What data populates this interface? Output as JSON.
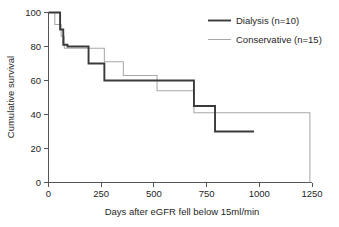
{
  "chart_data": {
    "type": "line",
    "title": "",
    "subtitle": "",
    "xlabel": "Days after eGFR fell below 15ml/min",
    "ylabel": "Cumulative survival",
    "xlim": [
      0,
      1250
    ],
    "ylim": [
      0,
      100
    ],
    "xticks": [
      0,
      250,
      500,
      750,
      1000,
      1250
    ],
    "xticklabels": [
      "0",
      "250",
      "500",
      "750",
      "1000",
      "1250"
    ],
    "yticks": [
      0,
      20,
      40,
      60,
      80,
      100
    ],
    "yticklabels": [
      "0",
      "20",
      "40",
      "60",
      "80",
      "100"
    ],
    "grid": false,
    "legend_position": "top-right",
    "step_style": "post",
    "series": [
      {
        "name": "Dialysis (n=10)",
        "label": "Dialysis (n=10)",
        "color": "#3a3a3a",
        "linewidth": "thick",
        "n": 10,
        "x": [
          0,
          55,
          55,
          70,
          70,
          90,
          90,
          190,
          190,
          265,
          265,
          690,
          690,
          790,
          790,
          975
        ],
        "y": [
          100,
          100,
          90,
          90,
          81,
          81,
          80,
          80,
          70,
          70,
          60,
          60,
          45,
          45,
          30,
          30
        ],
        "points": [
          {
            "days": 0,
            "survival": 100
          },
          {
            "days": 55,
            "survival": 90
          },
          {
            "days": 70,
            "survival": 81
          },
          {
            "days": 90,
            "survival": 80
          },
          {
            "days": 190,
            "survival": 70
          },
          {
            "days": 265,
            "survival": 60
          },
          {
            "days": 690,
            "survival": 45
          },
          {
            "days": 790,
            "survival": 30
          },
          {
            "days": 975,
            "survival": 30
          }
        ]
      },
      {
        "name": "Conservative (n=15)",
        "label": "Conservative (n=15)",
        "color": "#a8a8a8",
        "linewidth": "thin",
        "n": 15,
        "x": [
          0,
          30,
          30,
          60,
          60,
          75,
          75,
          130,
          130,
          265,
          265,
          355,
          355,
          515,
          515,
          690,
          690,
          1240,
          1240
        ],
        "y": [
          100,
          100,
          93,
          93,
          86,
          86,
          79,
          79,
          79,
          79,
          71,
          71,
          63,
          63,
          54,
          54,
          41,
          41,
          0
        ],
        "points": [
          {
            "days": 0,
            "survival": 100
          },
          {
            "days": 30,
            "survival": 93
          },
          {
            "days": 60,
            "survival": 86
          },
          {
            "days": 75,
            "survival": 79
          },
          {
            "days": 130,
            "survival": 79
          },
          {
            "days": 265,
            "survival": 71
          },
          {
            "days": 355,
            "survival": 63
          },
          {
            "days": 515,
            "survival": 54
          },
          {
            "days": 690,
            "survival": 41
          },
          {
            "days": 1240,
            "survival": 41
          },
          {
            "days": 1240,
            "survival": 0
          }
        ]
      }
    ]
  },
  "axes": {
    "x_title": "Days after eGFR fell below 15ml/min",
    "y_title": "Cumulative survival",
    "x_tick_0": "0",
    "x_tick_1": "250",
    "x_tick_2": "500",
    "x_tick_3": "750",
    "x_tick_4": "1000",
    "x_tick_5": "1250",
    "y_tick_0": "0",
    "y_tick_1": "20",
    "y_tick_2": "40",
    "y_tick_3": "60",
    "y_tick_4": "80",
    "y_tick_5": "100"
  },
  "legend": {
    "entries": [
      {
        "label": "Dialysis (n=10)",
        "color": "#3a3a3a"
      },
      {
        "label": "Conservative (n=15)",
        "color": "#a8a8a8"
      }
    ],
    "item_0_label": "Dialysis (n=10)",
    "item_1_label": "Conservative (n=15)"
  },
  "colors": {
    "dialysis": "#3a3a3a",
    "conservative": "#a8a8a8",
    "axis": "#555555",
    "text": "#262626",
    "background": "#ffffff"
  }
}
